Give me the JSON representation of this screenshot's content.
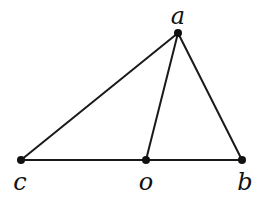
{
  "diagram": {
    "type": "triangle-with-cevian",
    "stroke_color": "#1a1a1a",
    "point_color": "#111111",
    "points": [
      {
        "id": "a",
        "label": "a",
        "x": 178,
        "y": 33,
        "label_x": 178,
        "label_y": 24
      },
      {
        "id": "b",
        "label": "b",
        "x": 242,
        "y": 160,
        "label_x": 245,
        "label_y": 190
      },
      {
        "id": "c",
        "label": "c",
        "x": 21,
        "label_x": 20,
        "y": 160,
        "label_y": 190
      },
      {
        "id": "o",
        "label": "o",
        "x": 146,
        "y": 160,
        "label_x": 146,
        "label_y": 190
      }
    ],
    "edges": [
      {
        "from": "c",
        "to": "a"
      },
      {
        "from": "a",
        "to": "b"
      },
      {
        "from": "a",
        "to": "o"
      },
      {
        "from": "c",
        "to": "o"
      },
      {
        "from": "o",
        "to": "b"
      }
    ]
  }
}
